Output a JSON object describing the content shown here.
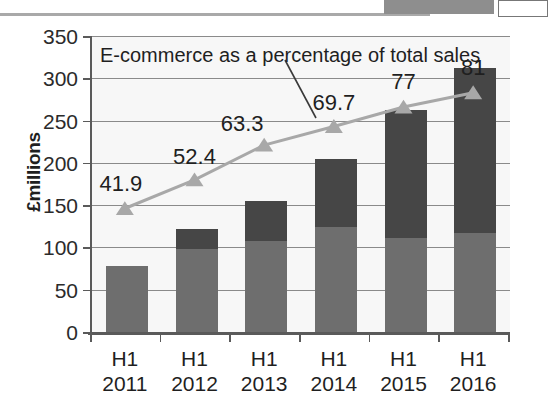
{
  "chart_data": {
    "type": "bar",
    "title": "",
    "xlabel": "",
    "ylabel": "£millions",
    "ylim": [
      0,
      350
    ],
    "ytick_step": 50,
    "yticks": [
      "0",
      "50",
      "100",
      "150",
      "200",
      "250",
      "300",
      "350"
    ],
    "grid": true,
    "legend": "none",
    "categories": [
      "H1\n2011",
      "H1\n2012",
      "H1\n2013",
      "H1\n2014",
      "H1\n2015",
      "H1\n2016"
    ],
    "category_lines": [
      {
        "l1": "H1",
        "l2": "2011"
      },
      {
        "l1": "H1",
        "l2": "2012"
      },
      {
        "l1": "H1",
        "l2": "2013"
      },
      {
        "l1": "H1",
        "l2": "2014"
      },
      {
        "l1": "H1",
        "l2": "2015"
      },
      {
        "l1": "H1",
        "l2": "2016"
      }
    ],
    "series": [
      {
        "name": "in-store sales",
        "stack": "total",
        "color": "#6e6e6e",
        "values": [
          78,
          98,
          108,
          124,
          111,
          117
        ]
      },
      {
        "name": "online sales",
        "stack": "total",
        "color": "#464646",
        "values": [
          0,
          24,
          47,
          80,
          151,
          195
        ]
      }
    ],
    "stack_totals": [
      78,
      122,
      155,
      204,
      262,
      312
    ],
    "line_series": {
      "name": "E-commerce as a percentage of total sales",
      "color": "#a8a8a8",
      "marker": "triangle",
      "unit": "%",
      "secondary_axis_ylim": [
        0,
        350
      ],
      "values": [
        41.9,
        52.4,
        63.3,
        69.7,
        77,
        81
      ],
      "plotted_as_y": [
        146,
        180,
        221,
        243,
        266,
        283
      ],
      "labels": [
        "41.9",
        "52.4",
        "63.3",
        "69.7",
        "77",
        "81"
      ]
    },
    "annotation": {
      "text": "E-commerce as a percentage of total sales",
      "has_leader_line": true
    }
  },
  "axes": {
    "y_title": "£millions"
  },
  "top_artifact": {
    "present": true,
    "description": "cropped-page-element"
  }
}
